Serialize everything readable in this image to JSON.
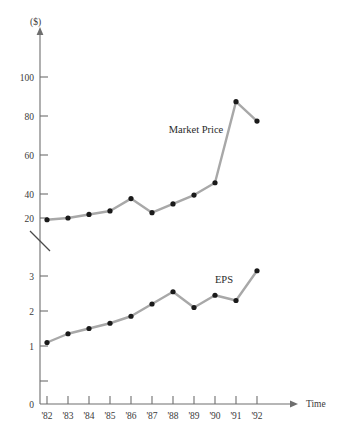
{
  "chart_data": {
    "type": "line",
    "title": "",
    "xlabel": "Time",
    "ylabel": "($)",
    "grid": false,
    "legend_position": "inline-annotation",
    "axis_break": true,
    "categories": [
      "'82",
      "'83",
      "'84",
      "'85",
      "'86",
      "'87",
      "'88",
      "'89",
      "'90",
      "'91",
      "'92"
    ],
    "panels": [
      {
        "name": "market-price",
        "label": "Market Price",
        "ylim": [
          0,
          115
        ],
        "yticks": [
          20,
          40,
          60,
          80,
          100
        ],
        "ytick_labels": [
          "20",
          "40",
          "60",
          "80",
          "100"
        ],
        "values": [
          19,
          20,
          22,
          24,
          31,
          23,
          28,
          33,
          40,
          86,
          75
        ]
      },
      {
        "name": "eps",
        "label": "EPS",
        "ylim": [
          0,
          3.6
        ],
        "yticks": [
          0,
          1,
          2,
          3
        ],
        "ytick_labels": [
          "0",
          "1",
          "2",
          "3"
        ],
        "values": [
          1.1,
          1.35,
          1.5,
          1.65,
          1.85,
          2.2,
          2.55,
          2.1,
          2.45,
          2.3,
          3.15
        ]
      }
    ],
    "series": [
      {
        "name": "Market Price",
        "values": [
          19,
          20,
          22,
          24,
          31,
          23,
          28,
          33,
          40,
          86,
          75
        ]
      },
      {
        "name": "EPS",
        "values": [
          1.1,
          1.35,
          1.5,
          1.65,
          1.85,
          2.2,
          2.55,
          2.1,
          2.45,
          2.3,
          3.15
        ]
      }
    ],
    "colors": {
      "line": "#a8a8a8",
      "marker": "#1a1a1a",
      "axis": "#6e6e6e",
      "text": "#2a2a2a",
      "background": "#ffffff"
    }
  },
  "labels": {
    "y_axis_unit": "($)",
    "x_axis_title": "Time",
    "market_price": "Market Price",
    "eps": "EPS"
  }
}
